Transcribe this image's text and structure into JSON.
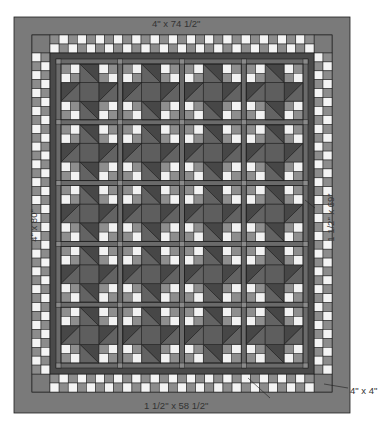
{
  "diagram": {
    "type": "quilt-layout",
    "layout": {
      "block_columns": 4,
      "block_rows": 5,
      "block_grid": "3x3 (four-patch corners, half-square-triangle edges, solid center)"
    },
    "labels": {
      "outer_border_top": "4\" x 74 1/2\"",
      "outer_border_side": "4\" x 80\"",
      "inner_border_side": "1 1/2\" x 69\"",
      "inner_border_bottom": "1 1/2\" x 58 1/2\"",
      "corner_square": "4\" x 4\""
    },
    "colors": {
      "outer_border": "#7a7a7a",
      "corner_square": "#7a7a7a",
      "checker_light": "#f4f4f4",
      "checker_dark": "#8c8c8c",
      "inner_border": "#4a4a4a",
      "sashing": "#6a6a6a",
      "cornerstone": "#8a8a8a",
      "hst_dark": "#474747",
      "hst_medium": "#636363",
      "block_center": "#5e5e5e",
      "four_patch_light": "#f2f2f2",
      "four_patch_dark": "#8e8e8e",
      "outline": "#1e1e1e"
    }
  }
}
